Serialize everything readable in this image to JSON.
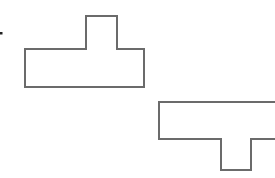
{
  "diagram": {
    "stroke_color": "#6b6b6b",
    "fill_color": "#ffffff",
    "bullet": {
      "x": 1,
      "y": 33,
      "size": 2.5
    },
    "shapes": [
      {
        "name": "t-shape-upright",
        "points": "25,49 86,49 86,16 117,16 117,49 144,49 144,87 25,87"
      },
      {
        "name": "t-shape-inverted",
        "points": "159,102 280,102 280,139 251,139 251,170 221,170 221,139 159,139"
      }
    ]
  }
}
